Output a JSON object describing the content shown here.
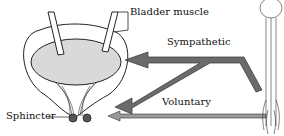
{
  "diagram": {
    "labels": {
      "bladder_muscle": "Bladder muscle",
      "sympathetic": "Sympathetic",
      "voluntary": "Voluntary",
      "sphincter": "Sphincter"
    },
    "colors": {
      "bladder_fill": "#d9d9d9",
      "arrow_fill": "#6b6b6b",
      "line": "#222222"
    }
  }
}
